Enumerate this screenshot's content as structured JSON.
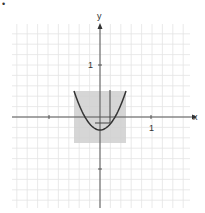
{
  "figure_marker": "•",
  "chart_data": {
    "type": "line",
    "title": "",
    "xlabel": "x",
    "ylabel": "y",
    "xlim": [
      -1.7,
      1.75
    ],
    "ylim": [
      -1.75,
      1.8
    ],
    "grid": true,
    "grid_step": 0.2,
    "tick_labels": {
      "x": [
        "1"
      ],
      "y": [
        "1"
      ]
    },
    "ticks": {
      "x": [
        -1,
        1
      ],
      "y": [
        1,
        -1
      ]
    },
    "series": [
      {
        "name": "parabola",
        "equation": "y = 3x^2 - 0.25",
        "x_range": [
          -0.5,
          0.5
        ],
        "color": "#333333"
      }
    ],
    "shaded_region": {
      "x": [
        -0.5,
        0.5
      ],
      "y": [
        -0.5,
        0.5
      ],
      "color": "#cccccc"
    },
    "annotations": [
      {
        "type": "segment",
        "from": [
          -0.1,
          -0.12
        ],
        "to": [
          0.2,
          -0.12
        ]
      },
      {
        "type": "segment",
        "from": [
          0.2,
          0.5
        ],
        "to": [
          0.2,
          -0.12
        ]
      }
    ]
  },
  "labels": {
    "x_axis": "x",
    "y_axis": "y",
    "x_tick_one": "1",
    "y_tick_one": "1"
  },
  "colors": {
    "grid": "#e4e4e4",
    "axis": "#555555",
    "curve": "#333333",
    "shade": "#cfcfcf"
  }
}
